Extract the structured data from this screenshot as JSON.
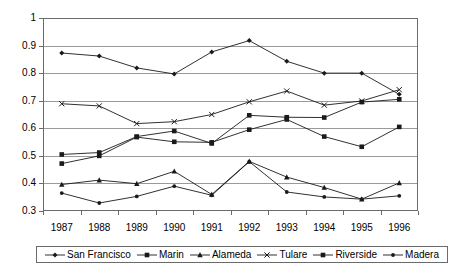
{
  "chart_data": {
    "type": "line",
    "title": "",
    "subtitle": "",
    "xlabel": "",
    "ylabel": "",
    "categories": [
      "1987",
      "1988",
      "1989",
      "1990",
      "1991",
      "1992",
      "1993",
      "1994",
      "1995",
      "1996"
    ],
    "x": [
      1987,
      1988,
      1989,
      1990,
      1991,
      1992,
      1993,
      1994,
      1995,
      1996
    ],
    "ylim": [
      0.3,
      1.0
    ],
    "ytick_labels": [
      "0.3",
      "0.4",
      "0.5",
      "0.6",
      "0.7",
      "0.8",
      "0.9",
      "1"
    ],
    "ytick_values": [
      0.3,
      0.4,
      0.5,
      0.6,
      0.7,
      0.8,
      0.9,
      1.0
    ],
    "grid": true,
    "legend_position": "bottom",
    "series": [
      {
        "name": "San Francisco",
        "marker": "diamond",
        "values": [
          0.873,
          0.862,
          0.819,
          0.797,
          0.877,
          0.918,
          0.843,
          0.8,
          0.8,
          0.723
        ]
      },
      {
        "name": "Marin",
        "marker": "square",
        "values": [
          0.505,
          0.512,
          0.57,
          0.59,
          0.545,
          0.647,
          0.64,
          0.639,
          0.695,
          0.705
        ]
      },
      {
        "name": "Alameda",
        "marker": "triangle",
        "values": [
          0.396,
          0.412,
          0.399,
          0.444,
          0.36,
          0.48,
          0.423,
          0.385,
          0.343,
          0.402
        ]
      },
      {
        "name": "Tulare",
        "marker": "cross",
        "values": [
          0.689,
          0.681,
          0.617,
          0.624,
          0.65,
          0.696,
          0.735,
          0.684,
          0.699,
          0.74
        ]
      },
      {
        "name": "Riverside",
        "marker": "square",
        "values": [
          0.472,
          0.5,
          0.568,
          0.551,
          0.549,
          0.595,
          0.632,
          0.57,
          0.533,
          0.605
        ]
      },
      {
        "name": "Madera",
        "marker": "dot",
        "values": [
          0.365,
          0.329,
          0.353,
          0.39,
          0.357,
          0.479,
          0.369,
          0.351,
          0.343,
          0.355
        ]
      }
    ]
  },
  "legend": {
    "entries": [
      {
        "label": "San Francisco",
        "marker": "diamond"
      },
      {
        "label": "Marin",
        "marker": "square"
      },
      {
        "label": "Alameda",
        "marker": "triangle"
      },
      {
        "label": "Tulare",
        "marker": "cross"
      },
      {
        "label": "Riverside",
        "marker": "square"
      },
      {
        "label": "Madera",
        "marker": "dot"
      }
    ]
  },
  "colors": {
    "line": "#1a1a1a",
    "grid": "#9a9a9a",
    "frame": "#6b6b6b",
    "text": "#000000",
    "background": "#ffffff"
  }
}
